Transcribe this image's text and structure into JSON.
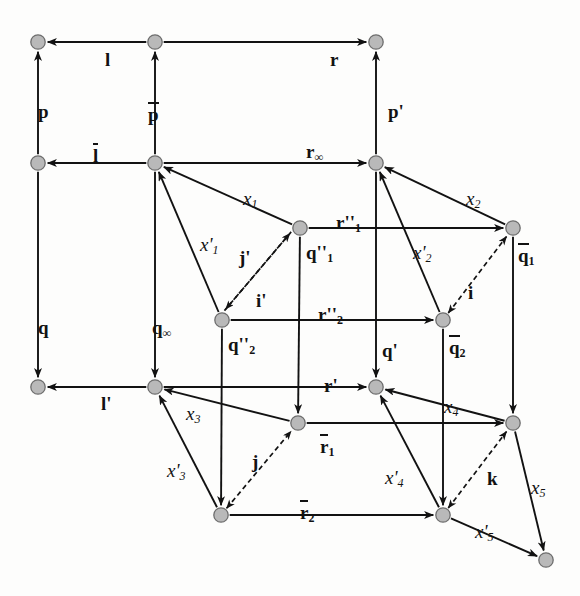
{
  "figure": {
    "kind": "commutative-diagram",
    "title": "",
    "background": "#fdfdfc",
    "node_fill": "#b9b9b9",
    "node_stroke": "#6e6e6e",
    "edge_color": "#121212",
    "dashed_edge_color": "#121212"
  },
  "nodes": [
    {
      "id": "n_tl",
      "x": 38,
      "y": 42,
      "label": ""
    },
    {
      "id": "n_tm",
      "x": 155,
      "y": 42,
      "label": ""
    },
    {
      "id": "n_tr",
      "x": 376,
      "y": 42,
      "label": ""
    },
    {
      "id": "n_ml",
      "x": 38,
      "y": 163,
      "label": ""
    },
    {
      "id": "n_mm",
      "x": 155,
      "y": 163,
      "label": ""
    },
    {
      "id": "n_mr",
      "x": 376,
      "y": 163,
      "label": ""
    },
    {
      "id": "n_q1",
      "x": 300,
      "y": 228,
      "label": "q''1"
    },
    {
      "id": "n_qb1",
      "x": 513,
      "y": 228,
      "label": "q-bar-1"
    },
    {
      "id": "n_q2",
      "x": 222,
      "y": 320,
      "label": "q''2"
    },
    {
      "id": "n_qb2",
      "x": 443,
      "y": 320,
      "label": "q-bar-2"
    },
    {
      "id": "n_bl",
      "x": 38,
      "y": 387,
      "label": ""
    },
    {
      "id": "n_bm",
      "x": 155,
      "y": 387,
      "label": ""
    },
    {
      "id": "n_br",
      "x": 376,
      "y": 387,
      "label": ""
    },
    {
      "id": "n_r1",
      "x": 298,
      "y": 423,
      "label": "r-bar-1"
    },
    {
      "id": "n_rr",
      "x": 513,
      "y": 423,
      "label": ""
    },
    {
      "id": "n_r2",
      "x": 221,
      "y": 515,
      "label": "r-bar-2"
    },
    {
      "id": "n_br2",
      "x": 443,
      "y": 515,
      "label": ""
    },
    {
      "id": "n_far",
      "x": 546,
      "y": 560,
      "label": ""
    }
  ],
  "edges": [
    {
      "name": "l",
      "from": "n_tm",
      "to": "n_tl",
      "style": "solid",
      "head": "end"
    },
    {
      "name": "r",
      "from": "n_tm",
      "to": "n_tr",
      "style": "solid",
      "head": "end"
    },
    {
      "name": "p",
      "from": "n_ml",
      "to": "n_tl",
      "style": "solid",
      "head": "end"
    },
    {
      "name": "p-bar",
      "from": "n_mm",
      "to": "n_tm",
      "style": "solid",
      "head": "end"
    },
    {
      "name": "p-prime",
      "from": "n_mr",
      "to": "n_tr",
      "style": "solid",
      "head": "end"
    },
    {
      "name": "l-bar",
      "from": "n_mm",
      "to": "n_ml",
      "style": "solid",
      "head": "end"
    },
    {
      "name": "r-inf",
      "from": "n_mm",
      "to": "n_mr",
      "style": "solid",
      "head": "end"
    },
    {
      "name": "q",
      "from": "n_ml",
      "to": "n_bl",
      "style": "solid",
      "head": "end"
    },
    {
      "name": "q-inf",
      "from": "n_mm",
      "to": "n_bm",
      "style": "solid",
      "head": "end"
    },
    {
      "name": "l-prime",
      "from": "n_bm",
      "to": "n_bl",
      "style": "solid",
      "head": "end"
    },
    {
      "name": "r-prime",
      "from": "n_bm",
      "to": "n_br",
      "style": "solid",
      "head": "end"
    },
    {
      "name": "q-prime",
      "from": "n_mr",
      "to": "n_br",
      "style": "solid",
      "head": "end"
    },
    {
      "name": "r2prime1",
      "from": "n_q1",
      "to": "n_qb1",
      "style": "solid",
      "head": "end"
    },
    {
      "name": "r2prime2",
      "from": "n_q2",
      "to": "n_qb2",
      "style": "solid",
      "head": "end"
    },
    {
      "name": "q1-q2",
      "from": "n_q1",
      "to": "n_r1",
      "style": "solid",
      "head": "end"
    },
    {
      "name": "qb1-qb2",
      "from": "n_qb1",
      "to": "n_rr",
      "style": "solid",
      "head": "end"
    },
    {
      "name": "q2-r2",
      "from": "n_q2",
      "to": "n_r2",
      "style": "solid",
      "head": "end"
    },
    {
      "name": "qb2-br2",
      "from": "n_qb2",
      "to": "n_br2",
      "style": "solid",
      "head": "end"
    },
    {
      "name": "rbar1",
      "from": "n_r1",
      "to": "n_rr",
      "style": "solid",
      "head": "end"
    },
    {
      "name": "rbar2",
      "from": "n_r2",
      "to": "n_br2",
      "style": "solid",
      "head": "end"
    },
    {
      "name": "x1",
      "from": "n_q1",
      "to": "n_mm",
      "style": "solid",
      "head": "end"
    },
    {
      "name": "x1prime",
      "from": "n_q2",
      "to": "n_mm",
      "style": "solid",
      "head": "end"
    },
    {
      "name": "x2",
      "from": "n_qb1",
      "to": "n_mr",
      "style": "solid",
      "head": "end"
    },
    {
      "name": "x2prime",
      "from": "n_qb2",
      "to": "n_mr",
      "style": "solid",
      "head": "end"
    },
    {
      "name": "x3",
      "from": "n_r1",
      "to": "n_bm",
      "style": "solid",
      "head": "end"
    },
    {
      "name": "x3prime",
      "from": "n_r2",
      "to": "n_bm",
      "style": "solid",
      "head": "end"
    },
    {
      "name": "x4",
      "from": "n_rr",
      "to": "n_br",
      "style": "solid",
      "head": "end"
    },
    {
      "name": "x4prime",
      "from": "n_br2",
      "to": "n_br",
      "style": "solid",
      "head": "end"
    },
    {
      "name": "x5",
      "from": "n_rr",
      "to": "n_far",
      "style": "solid",
      "head": "end"
    },
    {
      "name": "x5prime",
      "from": "n_br2",
      "to": "n_far",
      "style": "solid",
      "head": "end"
    },
    {
      "name": "j-prime",
      "from": "n_q2",
      "to": "n_q1",
      "style": "dashed",
      "head": "end"
    },
    {
      "name": "i-prime",
      "from": "n_q1",
      "to": "n_q2",
      "style": "dashed",
      "head": "end"
    },
    {
      "name": "i",
      "from": "n_qb2",
      "to": "n_qb1",
      "style": "dashed",
      "head": "both"
    },
    {
      "name": "j",
      "from": "n_r2",
      "to": "n_r1",
      "style": "dashed",
      "head": "both"
    },
    {
      "name": "k",
      "from": "n_br2",
      "to": "n_rr",
      "style": "dashed",
      "head": "both"
    }
  ],
  "labels": [
    {
      "name": "label-l",
      "text": "l",
      "x": 105,
      "y": 50,
      "style": "plain",
      "overbar": false
    },
    {
      "name": "label-r",
      "text": "r",
      "x": 330,
      "y": 50,
      "style": "plain",
      "overbar": false
    },
    {
      "name": "label-p",
      "text": "p",
      "x": 38,
      "y": 102,
      "style": "plain",
      "overbar": false
    },
    {
      "name": "label-p-bar",
      "text": "p",
      "x": 148,
      "y": 102,
      "style": "plain",
      "overbar": true
    },
    {
      "name": "label-p-prime",
      "text": "p'",
      "x": 388,
      "y": 102,
      "style": "plain",
      "overbar": false
    },
    {
      "name": "label-l-bar",
      "text": "l",
      "x": 93,
      "y": 143,
      "style": "plain",
      "overbar": true
    },
    {
      "name": "label-r-inf",
      "text": "r",
      "sub": "∞",
      "x": 306,
      "y": 142,
      "style": "plain",
      "overbar": false
    },
    {
      "name": "label-q",
      "text": "q",
      "x": 38,
      "y": 318,
      "style": "plain",
      "overbar": false
    },
    {
      "name": "label-q-inf",
      "text": "q",
      "sub": "∞",
      "x": 152,
      "y": 318,
      "style": "plain",
      "overbar": false
    },
    {
      "name": "label-l-prime",
      "text": "l'",
      "x": 101,
      "y": 394,
      "style": "plain",
      "overbar": false
    },
    {
      "name": "label-r-prime",
      "text": "r'",
      "x": 324,
      "y": 376,
      "style": "plain",
      "overbar": false
    },
    {
      "name": "label-q-prime",
      "text": "q'",
      "x": 382,
      "y": 341,
      "style": "plain",
      "overbar": false
    },
    {
      "name": "label-q2p1",
      "text": "q''",
      "sub": "1",
      "x": 306,
      "y": 243,
      "style": "plain",
      "overbar": false
    },
    {
      "name": "label-q2p2",
      "text": "q''",
      "sub": "2",
      "x": 228,
      "y": 335,
      "style": "plain",
      "overbar": false
    },
    {
      "name": "label-qbar1",
      "text": "q",
      "sub": "1",
      "x": 518,
      "y": 243,
      "style": "plain",
      "overbar": true
    },
    {
      "name": "label-qbar2",
      "text": "q",
      "sub": "2",
      "x": 449,
      "y": 335,
      "style": "plain",
      "overbar": true
    },
    {
      "name": "label-r2p1",
      "text": "r''",
      "sub": "1",
      "x": 336,
      "y": 213,
      "style": "plain",
      "overbar": false
    },
    {
      "name": "label-r2p2",
      "text": "r''",
      "sub": "2",
      "x": 318,
      "y": 305,
      "style": "plain",
      "overbar": false
    },
    {
      "name": "label-rbar1",
      "text": "r",
      "sub": "1",
      "x": 320,
      "y": 434,
      "style": "plain",
      "overbar": true
    },
    {
      "name": "label-rbar2",
      "text": "r",
      "sub": "2",
      "x": 300,
      "y": 500,
      "style": "plain",
      "overbar": true
    },
    {
      "name": "label-x1",
      "text": "x",
      "sub": "1",
      "x": 243,
      "y": 189,
      "style": "ital",
      "overbar": false
    },
    {
      "name": "label-x1prime",
      "text": "x'",
      "sub": "1",
      "x": 200,
      "y": 235,
      "style": "ital",
      "overbar": false
    },
    {
      "name": "label-x2",
      "text": "x",
      "sub": "2",
      "x": 466,
      "y": 189,
      "style": "ital",
      "overbar": false
    },
    {
      "name": "label-x2prime",
      "text": "x'",
      "sub": "2",
      "x": 413,
      "y": 243,
      "style": "ital",
      "overbar": false
    },
    {
      "name": "label-x3",
      "text": "x",
      "sub": "3",
      "x": 186,
      "y": 404,
      "style": "ital",
      "overbar": false
    },
    {
      "name": "label-x3prime",
      "text": "x'",
      "sub": "3",
      "x": 167,
      "y": 461,
      "style": "ital",
      "overbar": false
    },
    {
      "name": "label-x4",
      "text": "x",
      "sub": "4",
      "x": 444,
      "y": 397,
      "style": "ital",
      "overbar": false
    },
    {
      "name": "label-x4prime",
      "text": "x'",
      "sub": "4",
      "x": 385,
      "y": 468,
      "style": "ital",
      "overbar": false
    },
    {
      "name": "label-x5",
      "text": "x",
      "sub": "5",
      "x": 531,
      "y": 478,
      "style": "ital",
      "overbar": false
    },
    {
      "name": "label-x5prime",
      "text": "x'",
      "sub": "5",
      "x": 475,
      "y": 522,
      "style": "ital",
      "overbar": false
    },
    {
      "name": "label-j-prime",
      "text": "j'",
      "x": 239,
      "y": 248,
      "style": "plain",
      "overbar": false
    },
    {
      "name": "label-i-prime",
      "text": "i'",
      "x": 256,
      "y": 291,
      "style": "plain",
      "overbar": false
    },
    {
      "name": "label-i",
      "text": "i",
      "x": 468,
      "y": 283,
      "style": "plain",
      "overbar": false
    },
    {
      "name": "label-j",
      "text": "j",
      "x": 252,
      "y": 452,
      "style": "plain",
      "overbar": false
    },
    {
      "name": "label-k",
      "text": "k",
      "x": 487,
      "y": 469,
      "style": "plain",
      "overbar": false
    }
  ]
}
